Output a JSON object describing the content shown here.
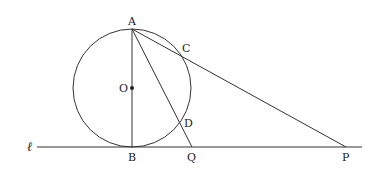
{
  "diagram": {
    "type": "geometry",
    "colors": {
      "stroke": "#333333",
      "text": "#222222",
      "background": "#ffffff"
    },
    "circle": {
      "center": "O",
      "cx": 132,
      "cy": 88,
      "r": 59
    },
    "points": {
      "A": {
        "label": "A",
        "x": 132,
        "y": 29
      },
      "B": {
        "label": "B",
        "x": 132,
        "y": 147
      },
      "O": {
        "label": "O",
        "x": 132,
        "y": 88
      },
      "C": {
        "label": "C",
        "x": 180,
        "y": 40
      },
      "D": {
        "label": "D",
        "x": 183,
        "y": 124
      },
      "Q": {
        "label": "Q",
        "x": 192,
        "y": 147
      },
      "P": {
        "label": "P",
        "x": 346,
        "y": 147
      }
    },
    "line_label": "ℓ",
    "segments": [
      "AB",
      "AP",
      "AQ",
      "line ℓ through B, Q, P"
    ]
  }
}
